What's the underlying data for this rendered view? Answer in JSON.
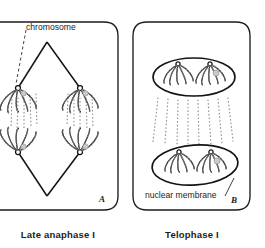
{
  "figure": {
    "title_visible": false,
    "background_color": "#ffffff",
    "ink_color": "#1a1a1a",
    "panels": [
      {
        "letter": "A",
        "caption": "Late anaphase I",
        "annotations": [
          {
            "text": "chromosome",
            "points_to": "upper-left chromosome cluster",
            "leader": "dashed"
          }
        ],
        "structures": [
          "cell outline",
          "spindle diamond",
          "four chromosome clusters",
          "dotted spindle fibers"
        ]
      },
      {
        "letter": "B",
        "caption": "Telophase I",
        "annotations": [
          {
            "text": "nuclear membrane",
            "points_to": "lower nucleus outline",
            "leader": "solid"
          }
        ],
        "structures": [
          "cell outline",
          "two nuclei",
          "chromosome clusters inside nuclei",
          "dotted spindle remnants"
        ]
      }
    ]
  },
  "labels": {
    "chromosome": "chromosome",
    "nuclear_membrane": "nuclear membrane",
    "panel_a_letter": "A",
    "panel_b_letter": "B",
    "caption_a": "Late anaphase I",
    "caption_b": "Telophase I"
  }
}
